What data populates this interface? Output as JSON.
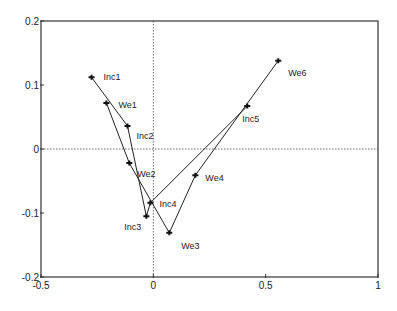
{
  "chart_data": {
    "type": "scatter",
    "title": "",
    "xlabel": "",
    "ylabel": "",
    "xlim": [
      -0.5,
      1
    ],
    "ylim": [
      -0.2,
      0.2
    ],
    "x_ticks": [
      -0.5,
      0,
      0.5,
      1
    ],
    "x_tick_labels": [
      "-0.5",
      "0",
      "0.5",
      "1"
    ],
    "y_ticks": [
      -0.2,
      -0.1,
      0,
      0.1,
      0.2
    ],
    "y_tick_labels": [
      "-0.2",
      "-0.1",
      "0",
      "0.1",
      "0.2"
    ],
    "grid": false,
    "reference_lines": {
      "x0": true,
      "y0": true,
      "style": "dotted"
    },
    "legend": "none",
    "series": [
      {
        "name": "Inc",
        "connected": true,
        "points": [
          {
            "label": "Inc1",
            "x": -0.275,
            "y": 0.112
          },
          {
            "label": "Inc2",
            "x": -0.115,
            "y": 0.036
          },
          {
            "label": "Inc3",
            "x": -0.031,
            "y": -0.105
          },
          {
            "label": "Inc4",
            "x": -0.013,
            "y": -0.084
          },
          {
            "label": "Inc5",
            "x": 0.418,
            "y": 0.067
          }
        ]
      },
      {
        "name": "We",
        "connected": true,
        "points": [
          {
            "label": "We1",
            "x": -0.209,
            "y": 0.072
          },
          {
            "label": "We2",
            "x": -0.107,
            "y": -0.022
          },
          {
            "label": "We3",
            "x": 0.071,
            "y": -0.131
          },
          {
            "label": "We4",
            "x": 0.187,
            "y": -0.041
          },
          {
            "label": "We6",
            "x": 0.556,
            "y": 0.138
          }
        ]
      }
    ]
  }
}
